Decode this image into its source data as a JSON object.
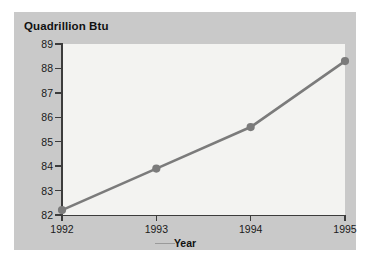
{
  "chart_data": {
    "type": "line",
    "title": "Quadrillion Btu",
    "xlabel": "Year",
    "ylabel": "Quadrillion Btu",
    "categories": [
      "1992",
      "1993",
      "1994",
      "1995"
    ],
    "x": [
      1992,
      1993,
      1994,
      1995
    ],
    "values": [
      82.2,
      83.9,
      85.6,
      88.3
    ],
    "series": [
      {
        "name": "Quadrillion Btu",
        "values": [
          82.2,
          83.9,
          85.6,
          88.3
        ]
      }
    ],
    "ylim": [
      82,
      89
    ],
    "xlim": [
      1992,
      1995
    ],
    "yticks": [
      82,
      83,
      84,
      85,
      86,
      87,
      88,
      89
    ],
    "ytick_labels": [
      "82",
      "83",
      "84",
      "85",
      "86",
      "87",
      "88",
      "89"
    ],
    "xticks": [
      1992,
      1993,
      1994,
      1995
    ],
    "xtick_labels": [
      "1992",
      "1993",
      "1994",
      "1995"
    ],
    "grid": false,
    "legend": false,
    "marker": "circle",
    "line_color": "#7b7b7b",
    "marker_color": "#7b7b7b",
    "plot_background": "#f3f3f1",
    "panel_background": "#c9c9c9",
    "axis_color": "#3c3c3c",
    "text_color": "#1a1a1a"
  }
}
